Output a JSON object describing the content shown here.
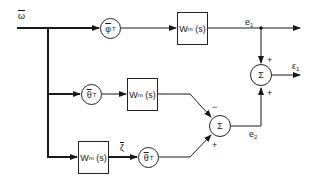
{
  "diagram": {
    "type": "block-diagram",
    "input": {
      "label": "ω",
      "overline": true
    },
    "blocks": {
      "phi_T": {
        "symbol": "φ",
        "sup": "T",
        "overline": true
      },
      "wm_top": {
        "main": "W",
        "sub": "m",
        "arg": "(s)"
      },
      "theta_T_mid": {
        "symbol": "θ",
        "sup": "T",
        "overline": true
      },
      "wm_mid": {
        "main": "W",
        "sub": "m",
        "arg": "(s)"
      },
      "wm_bot": {
        "main": "W",
        "sub": "m",
        "arg": "(s)"
      },
      "theta_T_bot": {
        "symbol": "θ",
        "sup": "T",
        "overline": true
      }
    },
    "signals": {
      "e1": {
        "main": "e",
        "sub": "1"
      },
      "e2": {
        "main": "e",
        "sub": "2"
      },
      "eps1": {
        "main": "ε",
        "sub": "1"
      },
      "zeta": {
        "label": "ζ",
        "overline": true
      }
    },
    "summers": {
      "middle": {
        "symbol": "Σ",
        "sign_top": "−",
        "sign_bottom": "+"
      },
      "right": {
        "symbol": "Σ",
        "sign_top": "+",
        "sign_bottom": "+"
      }
    }
  }
}
